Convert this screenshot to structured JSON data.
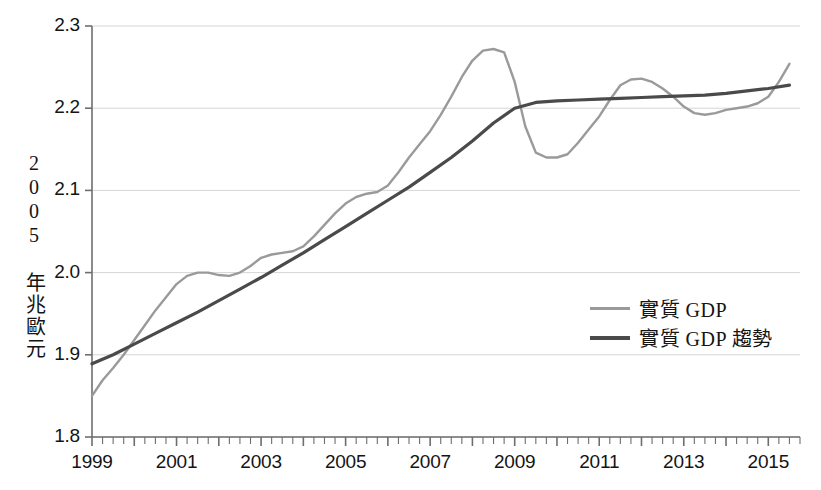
{
  "chart_data": {
    "type": "line",
    "title": "",
    "xlabel": "",
    "ylabel": "2005 年兆歐元",
    "xlim": [
      1999.0,
      2015.75
    ],
    "ylim": [
      1.8,
      2.3
    ],
    "grid": true,
    "grid_axis": "y",
    "legend_position": "middle-right",
    "x_tick_labels": [
      "1999",
      "2001",
      "2003",
      "2005",
      "2007",
      "2009",
      "2011",
      "2013",
      "2015"
    ],
    "x_tick_values": [
      1999,
      2001,
      2003,
      2005,
      2007,
      2009,
      2011,
      2013,
      2015
    ],
    "x_minor_tick_interval": 0.25,
    "y_tick_labels": [
      "1.8",
      "1.9",
      "2.0",
      "2.1",
      "2.2",
      "2.3"
    ],
    "y_tick_values": [
      1.8,
      1.9,
      2.0,
      2.1,
      2.2,
      2.3
    ],
    "colors": {
      "gdp_line": "#9a9a9a",
      "trend_line": "#4a4a4a",
      "gridline": "#d6d6d6",
      "axis": "#6e6e6e",
      "text": "#141414",
      "background": "#ffffff"
    },
    "series": [
      {
        "name": "實質 GDP",
        "color": "#9a9a9a",
        "width": 2.4,
        "x": [
          1999.0,
          1999.25,
          1999.5,
          1999.75,
          2000.0,
          2000.25,
          2000.5,
          2000.75,
          2001.0,
          2001.25,
          2001.5,
          2001.75,
          2002.0,
          2002.25,
          2002.5,
          2002.75,
          2003.0,
          2003.25,
          2003.5,
          2003.75,
          2004.0,
          2004.25,
          2004.5,
          2004.75,
          2005.0,
          2005.25,
          2005.5,
          2005.75,
          2006.0,
          2006.25,
          2006.5,
          2006.75,
          2007.0,
          2007.25,
          2007.5,
          2007.75,
          2008.0,
          2008.25,
          2008.5,
          2008.75,
          2009.0,
          2009.25,
          2009.5,
          2009.75,
          2010.0,
          2010.25,
          2010.5,
          2010.75,
          2011.0,
          2011.25,
          2011.5,
          2011.75,
          2012.0,
          2012.25,
          2012.5,
          2012.75,
          2013.0,
          2013.25,
          2013.5,
          2013.75,
          2014.0,
          2014.25,
          2014.5,
          2014.75,
          2015.0,
          2015.25,
          2015.5
        ],
        "y": [
          1.85,
          1.869,
          1.884,
          1.9,
          1.918,
          1.936,
          1.954,
          1.97,
          1.986,
          1.996,
          2.0,
          2.0,
          1.997,
          1.996,
          2.0,
          2.008,
          2.018,
          2.022,
          2.024,
          2.026,
          2.032,
          2.044,
          2.058,
          2.072,
          2.084,
          2.092,
          2.096,
          2.098,
          2.106,
          2.122,
          2.14,
          2.156,
          2.172,
          2.192,
          2.214,
          2.238,
          2.258,
          2.27,
          2.272,
          2.268,
          2.232,
          2.178,
          2.146,
          2.14,
          2.14,
          2.144,
          2.158,
          2.174,
          2.19,
          2.21,
          2.228,
          2.235,
          2.236,
          2.232,
          2.224,
          2.214,
          2.202,
          2.194,
          2.192,
          2.194,
          2.198,
          2.2,
          2.202,
          2.206,
          2.214,
          2.232,
          2.254
        ]
      },
      {
        "name": "實質 GDP 趨勢",
        "color": "#4a4a4a",
        "width": 3.2,
        "x": [
          1999.0,
          1999.5,
          2000.0,
          2000.5,
          2001.0,
          2001.5,
          2002.0,
          2002.5,
          2003.0,
          2003.5,
          2004.0,
          2004.5,
          2005.0,
          2005.5,
          2006.0,
          2006.5,
          2007.0,
          2007.5,
          2008.0,
          2008.5,
          2009.0,
          2009.5,
          2010.0,
          2010.5,
          2011.0,
          2011.5,
          2012.0,
          2012.5,
          2013.0,
          2013.5,
          2014.0,
          2014.5,
          2015.0,
          2015.5
        ],
        "y": [
          1.889,
          1.9,
          1.913,
          1.926,
          1.939,
          1.952,
          1.966,
          1.98,
          1.994,
          2.009,
          2.024,
          2.04,
          2.056,
          2.072,
          2.088,
          2.104,
          2.122,
          2.14,
          2.16,
          2.182,
          2.2,
          2.207,
          2.209,
          2.21,
          2.211,
          2.212,
          2.213,
          2.214,
          2.215,
          2.216,
          2.218,
          2.221,
          2.224,
          2.228
        ]
      }
    ],
    "annotations": {
      "peak_value": 2.272,
      "peak_year": 2008.5,
      "trough_value": 2.14,
      "trough_year": 2009.75,
      "start_value": 1.85,
      "end_value": 2.254
    }
  },
  "axis_titles": {
    "y_axis": "2005 年兆歐元"
  },
  "legend": {
    "items": [
      {
        "label": "實質 GDP",
        "color": "#9a9a9a"
      },
      {
        "label": "實質 GDP 趨勢",
        "color": "#4a4a4a"
      }
    ]
  },
  "ticks": {
    "y": [
      {
        "label": "2.3",
        "value": 2.3
      },
      {
        "label": "2.2",
        "value": 2.2
      },
      {
        "label": "2.1",
        "value": 2.1
      },
      {
        "label": "2.0",
        "value": 2.0
      },
      {
        "label": "1.9",
        "value": 1.9
      },
      {
        "label": "1.8",
        "value": 1.8
      }
    ],
    "x": [
      {
        "label": "1999",
        "value": 1999
      },
      {
        "label": "2001",
        "value": 2001
      },
      {
        "label": "2003",
        "value": 2003
      },
      {
        "label": "2005",
        "value": 2005
      },
      {
        "label": "2007",
        "value": 2007
      },
      {
        "label": "2009",
        "value": 2009
      },
      {
        "label": "2011",
        "value": 2011
      },
      {
        "label": "2013",
        "value": 2013
      },
      {
        "label": "2015",
        "value": 2015
      }
    ]
  }
}
